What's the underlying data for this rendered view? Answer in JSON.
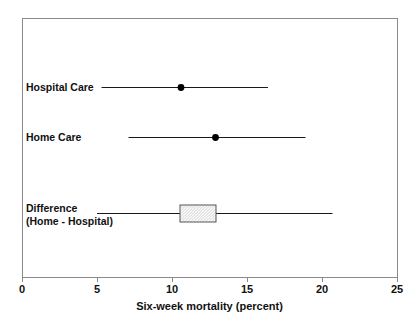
{
  "chart_data": {
    "type": "scatter",
    "title": "",
    "subtitle": "",
    "xlabel": "Six-week mortality (percent)",
    "ylabel": "",
    "xlim": [
      0,
      25
    ],
    "xticks": [
      0,
      5,
      10,
      15,
      20,
      25
    ],
    "xtick_labels": [
      "0",
      "5",
      "10",
      "15",
      "20",
      "25"
    ],
    "grid": false,
    "legend": "none",
    "frame": "box",
    "orientation": "horizontal",
    "rows": [
      {
        "label": "Hospital Care",
        "label_line2": "",
        "estimate": 10.6,
        "ci_low": 5.3,
        "ci_high": 16.4,
        "marker": "filled-circle",
        "box": null
      },
      {
        "label": "Home Care",
        "label_line2": "",
        "estimate": 12.9,
        "ci_low": 7.1,
        "ci_high": 18.9,
        "marker": "filled-circle",
        "box": null
      },
      {
        "label": "Difference",
        "label_line2": "(Home - Hospital)",
        "estimate": null,
        "ci_low": 5.0,
        "ci_high": 20.7,
        "marker": "hatched-box",
        "box": {
          "low": 10.5,
          "high": 12.9
        }
      }
    ],
    "colors": {
      "line": "#1a1a1a",
      "marker": "#000000",
      "box_fill": "#e0e0e0",
      "box_edge": "#555555",
      "frame": "#8a8a8a",
      "text": "#111111",
      "background": "#ffffff"
    }
  }
}
